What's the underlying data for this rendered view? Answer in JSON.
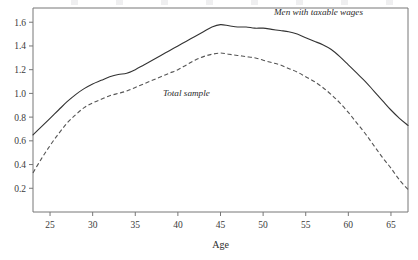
{
  "chart_data": {
    "type": "line",
    "title": "",
    "xlabel": "Age",
    "ylabel": "",
    "xlim": [
      23,
      67
    ],
    "ylim": [
      0,
      1.72
    ],
    "grid": false,
    "legend_position": "inline-annotations",
    "xticks": [
      25,
      30,
      35,
      40,
      45,
      50,
      55,
      60,
      65
    ],
    "xtick_labels": [
      "25",
      "30",
      "35",
      "40",
      "45",
      "50",
      "55",
      "60",
      "65"
    ],
    "yticks": [
      0.2,
      0.4,
      0.6,
      0.8,
      1.0,
      1.2,
      1.4,
      1.6
    ],
    "ytick_labels": [
      "0.2",
      "0.4",
      "0.6",
      "0.8",
      "1.0",
      "1.2",
      "1.4",
      "1.6"
    ],
    "x": [
      23,
      24,
      25,
      26,
      27,
      28,
      29,
      30,
      31,
      32,
      33,
      34,
      35,
      36,
      37,
      38,
      39,
      40,
      41,
      42,
      43,
      44,
      45,
      46,
      47,
      48,
      49,
      50,
      51,
      52,
      53,
      54,
      55,
      56,
      57,
      58,
      59,
      60,
      61,
      62,
      63,
      64,
      65,
      66,
      67
    ],
    "series": [
      {
        "name": "Men with taxable wages",
        "style": "solid",
        "color": "#333333",
        "label_x": 56.5,
        "label_y": 1.66,
        "values": [
          0.65,
          0.72,
          0.79,
          0.86,
          0.93,
          0.99,
          1.04,
          1.08,
          1.11,
          1.14,
          1.16,
          1.17,
          1.2,
          1.24,
          1.28,
          1.32,
          1.36,
          1.4,
          1.44,
          1.48,
          1.52,
          1.56,
          1.58,
          1.57,
          1.56,
          1.56,
          1.55,
          1.55,
          1.54,
          1.53,
          1.52,
          1.5,
          1.47,
          1.44,
          1.41,
          1.37,
          1.31,
          1.24,
          1.17,
          1.1,
          1.02,
          0.94,
          0.86,
          0.79,
          0.73
        ]
      },
      {
        "name": "Total sample",
        "style": "dashed",
        "color": "#555555",
        "label_x": 41.0,
        "label_y": 0.98,
        "values": [
          0.33,
          0.45,
          0.56,
          0.66,
          0.75,
          0.82,
          0.88,
          0.92,
          0.95,
          0.98,
          1.0,
          1.02,
          1.05,
          1.08,
          1.11,
          1.14,
          1.17,
          1.2,
          1.24,
          1.28,
          1.31,
          1.33,
          1.34,
          1.33,
          1.32,
          1.31,
          1.3,
          1.28,
          1.26,
          1.24,
          1.21,
          1.18,
          1.14,
          1.1,
          1.05,
          0.99,
          0.92,
          0.84,
          0.75,
          0.66,
          0.56,
          0.46,
          0.37,
          0.27,
          0.19
        ]
      }
    ]
  }
}
